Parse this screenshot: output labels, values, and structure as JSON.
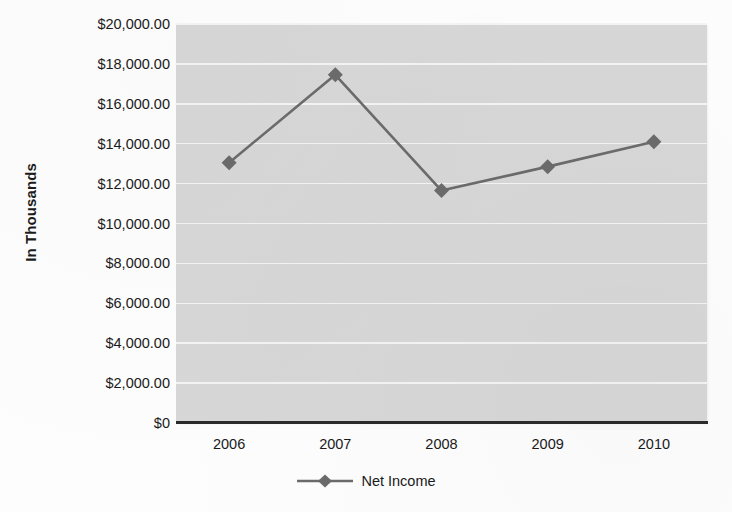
{
  "chart_data": {
    "type": "line",
    "title": "",
    "xlabel": "",
    "ylabel": "In Thousands",
    "categories": [
      "2006",
      "2007",
      "2008",
      "2009",
      "2010"
    ],
    "series": [
      {
        "name": "Net Income",
        "values": [
          13050,
          17450,
          11650,
          12850,
          14100
        ],
        "color": "#6b6b6b",
        "marker": "diamond",
        "marker_color": "#6b6b6b"
      }
    ],
    "ylim": [
      0,
      20000
    ],
    "ytick_values": [
      0,
      2000,
      4000,
      6000,
      8000,
      10000,
      12000,
      14000,
      16000,
      18000,
      20000
    ],
    "ytick_labels": [
      "$0",
      "$2,000.00",
      "$4,000.00",
      "$6,000.00",
      "$8,000.00",
      "$10,000.00",
      "$12,000.00",
      "$14,000.00",
      "$16,000.00",
      "$18,000.00",
      "$20,000.00"
    ],
    "grid": true,
    "grid_color": "#f4f4f4",
    "plot_background": "#d7d7d7",
    "axis_color": "#2b2b2b",
    "legend_position": "bottom",
    "legend_entries": [
      "Net Income"
    ]
  }
}
